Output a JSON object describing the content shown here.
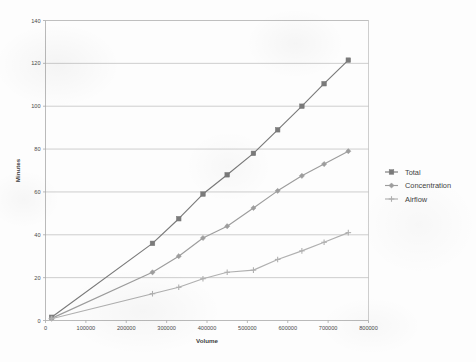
{
  "chart_data": {
    "type": "line",
    "title": "",
    "xlabel": "Volume",
    "ylabel": "Minutes",
    "xlim": [
      0,
      800000
    ],
    "ylim": [
      0,
      140
    ],
    "xticks": [
      0,
      100000,
      200000,
      300000,
      400000,
      500000,
      600000,
      700000,
      800000
    ],
    "xtick_labels": [
      "0",
      "100000",
      "200000",
      "300000",
      "400000",
      "500000",
      "600000",
      "700000",
      "800000"
    ],
    "yticks": [
      0,
      20,
      40,
      60,
      80,
      100,
      120,
      140
    ],
    "ytick_labels": [
      "0",
      "20",
      "40",
      "60",
      "80",
      "100",
      "120",
      "140"
    ],
    "grid": "horizontal",
    "legend_position": "right",
    "series": [
      {
        "name": "Total",
        "color": "#7a7a7a",
        "marker": "square",
        "x": [
          15000,
          265000,
          330000,
          390000,
          450000,
          515000,
          575000,
          635000,
          690000,
          750000
        ],
        "values": [
          1.5,
          36,
          47.5,
          59,
          68,
          78,
          89,
          100,
          110.5,
          121.5
        ]
      },
      {
        "name": "Concentration",
        "color": "#9d9d9d",
        "marker": "diamond",
        "x": [
          15000,
          265000,
          330000,
          390000,
          450000,
          515000,
          575000,
          635000,
          690000,
          750000
        ],
        "values": [
          1.0,
          22.5,
          30,
          38.5,
          44,
          52.5,
          60.5,
          67.5,
          73,
          79
        ]
      },
      {
        "name": "Airflow",
        "color": "#b0b0b0",
        "marker": "plus",
        "x": [
          15000,
          265000,
          330000,
          390000,
          450000,
          515000,
          575000,
          635000,
          690000,
          750000
        ],
        "values": [
          0.8,
          12.5,
          15.5,
          19.5,
          22.5,
          23.5,
          28.5,
          32.5,
          36.5,
          41
        ]
      }
    ]
  },
  "legend": {
    "items": [
      {
        "label": "Total"
      },
      {
        "label": "Concentration"
      },
      {
        "label": "Airflow"
      }
    ]
  }
}
